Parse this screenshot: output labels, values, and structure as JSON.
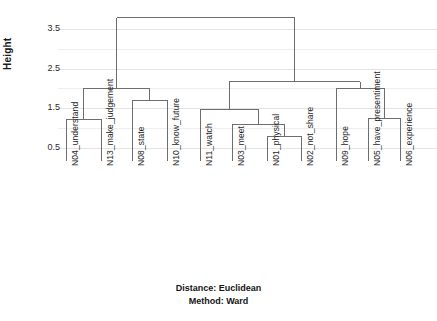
{
  "chart_data": {
    "type": "dendrogram",
    "title": "",
    "xlabel": "",
    "ylabel": "Height",
    "ylim": [
      0.0,
      4.0
    ],
    "ytick_labels": [
      "0.5",
      "1.5",
      "2.5",
      "3.5"
    ],
    "ytick_values": [
      0.5,
      1.5,
      2.5,
      3.5
    ],
    "grid": true,
    "grid_values": [
      0.5,
      1.0,
      1.5,
      2.0,
      2.5,
      3.0,
      3.5
    ],
    "legend": null,
    "leaf_labels": [
      "N04_understand",
      "N13_make_judgement",
      "N08_state",
      "N10_know_future",
      "N11_watch",
      "N03_meet",
      "N01_physical",
      "N02_not_share",
      "N09_hope",
      "N05_have_presentiment",
      "N06_experience"
    ],
    "leaf_x": [
      66,
      101,
      132,
      167,
      200,
      232,
      267,
      301,
      336,
      368,
      400
    ],
    "merges": [
      {
        "id": "m1",
        "left": "N04_understand",
        "right": "N13_make_judgement",
        "height": 1.22
      },
      {
        "id": "m2",
        "left": "N08_state",
        "right": "N10_know_future",
        "height": 1.7
      },
      {
        "id": "m3",
        "left": "m1",
        "right": "m2",
        "height": 2.0
      },
      {
        "id": "m4",
        "left": "N01_physical",
        "right": "N02_not_share",
        "height": 0.8
      },
      {
        "id": "m5",
        "left": "N03_meet",
        "right": "m4",
        "height": 1.1
      },
      {
        "id": "m6",
        "left": "N11_watch",
        "right": "m5",
        "height": 1.47
      },
      {
        "id": "m7",
        "left": "N05_have_presentiment",
        "right": "N06_experience",
        "height": 1.25
      },
      {
        "id": "m8",
        "left": "N09_hope",
        "right": "m7",
        "height": 2.0
      },
      {
        "id": "m9",
        "left": "m6",
        "right": "m8",
        "height": 2.17
      },
      {
        "id": "m10",
        "left": "m3",
        "right": "m9",
        "height": 3.78
      }
    ],
    "line_color": "#6e6e6e",
    "grid_color": "#ececec",
    "text_color": "#222222"
  },
  "axis": {
    "y_title": "Height",
    "ticks": [
      "3.5",
      "2.5",
      "1.5",
      "0.5"
    ]
  },
  "footer": {
    "line1": "Distance: Euclidean",
    "line2": "Method: Ward"
  }
}
